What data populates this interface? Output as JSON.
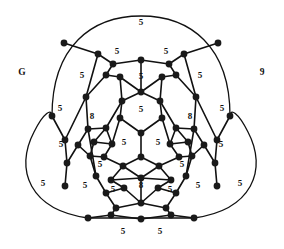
{
  "figure": {
    "title": "",
    "left_label": "G",
    "right_label": "9",
    "background_color": "#ffffff",
    "line_color": "#111111",
    "node_color": "#1a1a1a"
  },
  "graph_data": {
    "type": "planar-graph",
    "symmetry": "3-fold rotational",
    "node_radius": 3.4,
    "nodes": [
      {
        "id": 0,
        "x": 141,
        "y": 133
      },
      {
        "id": 1,
        "x": 120,
        "y": 118
      },
      {
        "id": 2,
        "x": 162,
        "y": 118
      },
      {
        "id": 3,
        "x": 141,
        "y": 157
      },
      {
        "id": 4,
        "x": 122,
        "y": 101
      },
      {
        "id": 5,
        "x": 160,
        "y": 101
      },
      {
        "id": 6,
        "x": 170,
        "y": 144
      },
      {
        "id": 7,
        "x": 159,
        "y": 166
      },
      {
        "id": 8,
        "x": 112,
        "y": 144
      },
      {
        "id": 9,
        "x": 123,
        "y": 166
      },
      {
        "id": 10,
        "x": 141,
        "y": 92
      },
      {
        "id": 11,
        "x": 176,
        "y": 128
      },
      {
        "id": 12,
        "x": 141,
        "y": 178
      },
      {
        "id": 13,
        "x": 106,
        "y": 128
      },
      {
        "id": 14,
        "x": 104,
        "y": 157
      },
      {
        "id": 15,
        "x": 179,
        "y": 157
      },
      {
        "id": 16,
        "x": 120,
        "y": 77
      },
      {
        "id": 17,
        "x": 162,
        "y": 77
      },
      {
        "id": 18,
        "x": 188,
        "y": 142
      },
      {
        "id": 19,
        "x": 171,
        "y": 180
      },
      {
        "id": 20,
        "x": 111,
        "y": 180
      },
      {
        "id": 21,
        "x": 94,
        "y": 142
      },
      {
        "id": 22,
        "x": 106,
        "y": 75
      },
      {
        "id": 23,
        "x": 176,
        "y": 75
      },
      {
        "id": 24,
        "x": 192,
        "y": 156
      },
      {
        "id": 25,
        "x": 158,
        "y": 188
      },
      {
        "id": 26,
        "x": 124,
        "y": 188
      },
      {
        "id": 27,
        "x": 90,
        "y": 156
      },
      {
        "id": 28,
        "x": 141,
        "y": 60
      },
      {
        "id": 29,
        "x": 194,
        "y": 129
      },
      {
        "id": 30,
        "x": 88,
        "y": 129
      },
      {
        "id": 31,
        "x": 141,
        "y": 203
      },
      {
        "id": 32,
        "x": 186,
        "y": 176
      },
      {
        "id": 33,
        "x": 96,
        "y": 176
      },
      {
        "id": 34,
        "x": 113,
        "y": 64
      },
      {
        "id": 35,
        "x": 169,
        "y": 64
      },
      {
        "id": 36,
        "x": 204,
        "y": 145
      },
      {
        "id": 37,
        "x": 176,
        "y": 193
      },
      {
        "id": 38,
        "x": 106,
        "y": 193
      },
      {
        "id": 39,
        "x": 78,
        "y": 145
      },
      {
        "id": 40,
        "x": 98,
        "y": 54
      },
      {
        "id": 41,
        "x": 184,
        "y": 54
      },
      {
        "id": 42,
        "x": 215,
        "y": 163
      },
      {
        "id": 43,
        "x": 166,
        "y": 208
      },
      {
        "id": 44,
        "x": 116,
        "y": 208
      },
      {
        "id": 45,
        "x": 67,
        "y": 163
      },
      {
        "id": 46,
        "x": 86,
        "y": 97
      },
      {
        "id": 47,
        "x": 196,
        "y": 97
      },
      {
        "id": 48,
        "x": 217,
        "y": 140
      },
      {
        "id": 49,
        "x": 65,
        "y": 140
      },
      {
        "id": 50,
        "x": 111,
        "y": 215
      },
      {
        "id": 51,
        "x": 171,
        "y": 215
      },
      {
        "id": 52,
        "x": 64,
        "y": 43
      },
      {
        "id": 53,
        "x": 218,
        "y": 43
      },
      {
        "id": 54,
        "x": 230,
        "y": 116
      },
      {
        "id": 55,
        "x": 52,
        "y": 116
      },
      {
        "id": 56,
        "x": 88,
        "y": 218
      },
      {
        "id": 57,
        "x": 194,
        "y": 218
      },
      {
        "id": 58,
        "x": 141,
        "y": 219
      },
      {
        "id": 59,
        "x": 65,
        "y": 186
      },
      {
        "id": 60,
        "x": 217,
        "y": 186
      }
    ],
    "face_labels": [
      {
        "value": "5",
        "x": 141,
        "y": 23
      },
      {
        "value": "5",
        "x": 117,
        "y": 52
      },
      {
        "value": "5",
        "x": 166,
        "y": 52
      },
      {
        "value": "5",
        "x": 141,
        "y": 77
      },
      {
        "value": "5",
        "x": 141,
        "y": 110
      },
      {
        "value": "5",
        "x": 124,
        "y": 143
      },
      {
        "value": "5",
        "x": 158,
        "y": 143
      },
      {
        "value": "8",
        "x": 92,
        "y": 117
      },
      {
        "value": "8",
        "x": 190,
        "y": 117
      },
      {
        "value": "8",
        "x": 141,
        "y": 186
      },
      {
        "value": "5",
        "x": 113,
        "y": 190
      },
      {
        "value": "5",
        "x": 170,
        "y": 190
      },
      {
        "value": "5",
        "x": 82,
        "y": 76
      },
      {
        "value": "5",
        "x": 200,
        "y": 76
      },
      {
        "value": "5",
        "x": 60,
        "y": 109
      },
      {
        "value": "5",
        "x": 222,
        "y": 109
      },
      {
        "value": "5",
        "x": 61,
        "y": 145
      },
      {
        "value": "5",
        "x": 221,
        "y": 145
      },
      {
        "value": "5",
        "x": 100,
        "y": 165
      },
      {
        "value": "5",
        "x": 182,
        "y": 165
      },
      {
        "value": "5",
        "x": 85,
        "y": 186
      },
      {
        "value": "5",
        "x": 198,
        "y": 186
      },
      {
        "value": "5",
        "x": 43,
        "y": 184
      },
      {
        "value": "5",
        "x": 240,
        "y": 184
      },
      {
        "value": "5",
        "x": 123,
        "y": 232
      },
      {
        "value": "5",
        "x": 160,
        "y": 232
      }
    ],
    "edges": [
      [
        0,
        1
      ],
      [
        0,
        2
      ],
      [
        0,
        3
      ],
      [
        1,
        4
      ],
      [
        1,
        8
      ],
      [
        2,
        5
      ],
      [
        2,
        6
      ],
      [
        3,
        7
      ],
      [
        3,
        9
      ],
      [
        4,
        10
      ],
      [
        4,
        13
      ],
      [
        5,
        10
      ],
      [
        5,
        11
      ],
      [
        6,
        11
      ],
      [
        6,
        15
      ],
      [
        7,
        15
      ],
      [
        7,
        12
      ],
      [
        9,
        12
      ],
      [
        9,
        14
      ],
      [
        8,
        14
      ],
      [
        8,
        13
      ],
      [
        10,
        28
      ],
      [
        11,
        29
      ],
      [
        13,
        30
      ],
      [
        12,
        31
      ],
      [
        15,
        24
      ],
      [
        14,
        27
      ],
      [
        4,
        16
      ],
      [
        5,
        17
      ],
      [
        6,
        18
      ],
      [
        7,
        19
      ],
      [
        9,
        20
      ],
      [
        8,
        21
      ],
      [
        16,
        22
      ],
      [
        16,
        10
      ],
      [
        17,
        23
      ],
      [
        17,
        10
      ],
      [
        18,
        24
      ],
      [
        18,
        11
      ],
      [
        19,
        25
      ],
      [
        19,
        12
      ],
      [
        20,
        26
      ],
      [
        20,
        12
      ],
      [
        21,
        27
      ],
      [
        21,
        13
      ],
      [
        22,
        34
      ],
      [
        23,
        35
      ],
      [
        24,
        32
      ],
      [
        25,
        31
      ],
      [
        26,
        31
      ],
      [
        27,
        33
      ],
      [
        22,
        46
      ],
      [
        23,
        47
      ],
      [
        24,
        36
      ],
      [
        25,
        37
      ],
      [
        26,
        38
      ],
      [
        27,
        39
      ],
      [
        28,
        34
      ],
      [
        28,
        35
      ],
      [
        29,
        36
      ],
      [
        30,
        39
      ],
      [
        31,
        43
      ],
      [
        31,
        44
      ],
      [
        34,
        40
      ],
      [
        35,
        41
      ],
      [
        36,
        42
      ],
      [
        37,
        43
      ],
      [
        38,
        44
      ],
      [
        39,
        45
      ],
      [
        32,
        37
      ],
      [
        32,
        29
      ],
      [
        33,
        38
      ],
      [
        33,
        30
      ],
      [
        29,
        47
      ],
      [
        30,
        46
      ],
      [
        40,
        46
      ],
      [
        41,
        47
      ],
      [
        42,
        48
      ],
      [
        45,
        49
      ],
      [
        44,
        50
      ],
      [
        43,
        51
      ],
      [
        46,
        49
      ],
      [
        47,
        48
      ],
      [
        50,
        56
      ],
      [
        51,
        57
      ],
      [
        48,
        54
      ],
      [
        49,
        55
      ],
      [
        40,
        52
      ],
      [
        41,
        53
      ],
      [
        42,
        60
      ],
      [
        45,
        59
      ],
      [
        50,
        58
      ],
      [
        51,
        58
      ]
    ],
    "boundary_arcs": [
      {
        "name": "top-lobe",
        "d": "M 52 116 C 52 46, 92 16, 141 16 C 190 16, 230 46, 230 116"
      },
      {
        "name": "left-lobe",
        "d": "M 88 218 C 30 210, 14 170, 34 132 C 44 112, 52 108, 52 116"
      },
      {
        "name": "right-lobe",
        "d": "M 194 218 C 252 210, 268 170, 248 132 C 238 112, 230 108, 230 116"
      },
      {
        "name": "bottom-chord",
        "d": "M 88 218 L 194 218"
      }
    ]
  }
}
